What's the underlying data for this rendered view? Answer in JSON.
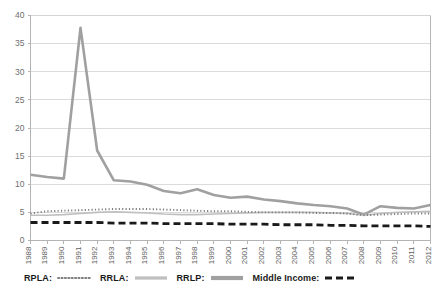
{
  "chart_data": {
    "type": "line",
    "title": "",
    "xlabel": "",
    "ylabel": "",
    "ylim": [
      0,
      40
    ],
    "ytick_step": 5,
    "yticks": [
      "0",
      "5",
      "10",
      "15",
      "20",
      "25",
      "30",
      "35",
      "40"
    ],
    "grid": true,
    "legend_position": "bottom",
    "categories": [
      "1988",
      "1989",
      "1990",
      "1991",
      "1992",
      "1993",
      "1994",
      "1995",
      "1996",
      "1997",
      "1998",
      "1999",
      "2000",
      "2001",
      "2002",
      "2003",
      "2004",
      "2005",
      "2006",
      "2007",
      "2008",
      "2009",
      "2010",
      "2011",
      "2012"
    ],
    "series": [
      {
        "name": "RPLA",
        "style": "dotted",
        "color": "#7f7f7f",
        "values": [
          4.8,
          5.2,
          5.3,
          5.4,
          5.5,
          5.6,
          5.6,
          5.6,
          5.5,
          5.4,
          5.3,
          5.2,
          5.2,
          5.1,
          5.0,
          5.0,
          5.0,
          4.9,
          4.9,
          4.8,
          4.5,
          4.6,
          4.7,
          4.8,
          4.8
        ]
      },
      {
        "name": "RRLA",
        "style": "solid-thin",
        "color": "#bfbfbf",
        "values": [
          4.5,
          4.5,
          4.6,
          4.8,
          5.0,
          5.1,
          5.0,
          4.9,
          4.7,
          4.6,
          4.6,
          4.7,
          4.8,
          4.9,
          5.0,
          5.0,
          5.0,
          5.0,
          4.9,
          4.8,
          4.5,
          4.8,
          5.0,
          5.1,
          5.2
        ]
      },
      {
        "name": "RRLP",
        "style": "solid-thick",
        "color": "#a0a0a0",
        "values": [
          11.7,
          11.3,
          11.0,
          37.8,
          16.0,
          10.7,
          10.5,
          9.9,
          8.8,
          8.4,
          9.1,
          8.1,
          7.6,
          7.8,
          7.3,
          7.0,
          6.6,
          6.3,
          6.1,
          5.7,
          4.6,
          6.1,
          5.8,
          5.7,
          6.3
        ]
      },
      {
        "name": "Middle Income",
        "style": "dashed",
        "color": "#1a1a1a",
        "values": [
          3.2,
          3.2,
          3.2,
          3.2,
          3.2,
          3.1,
          3.1,
          3.1,
          3.0,
          3.0,
          3.0,
          3.0,
          2.9,
          2.9,
          2.9,
          2.8,
          2.8,
          2.8,
          2.7,
          2.7,
          2.6,
          2.6,
          2.6,
          2.6,
          2.5
        ]
      }
    ]
  },
  "legend": {
    "entries": [
      {
        "label": "RPLA:",
        "style": "dotted"
      },
      {
        "label": "RRLA:",
        "style": "solid-thin"
      },
      {
        "label": "RRLP:",
        "style": "solid-thick"
      },
      {
        "label": "Middle Income:",
        "style": "dashed"
      }
    ]
  }
}
